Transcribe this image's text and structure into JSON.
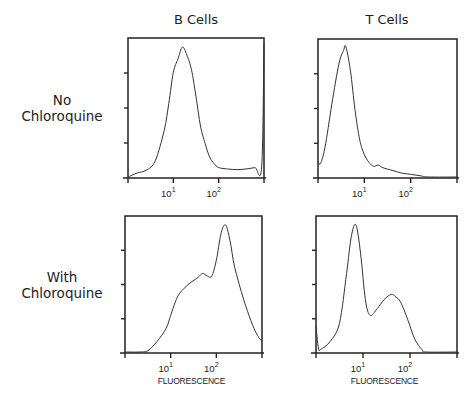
{
  "figure": {
    "column_titles": [
      "B  Cells",
      "T  Cells"
    ],
    "row_labels": [
      [
        "No",
        "Chloroquine"
      ],
      [
        "With",
        "Chloroquine"
      ]
    ],
    "x_axis_label": "FLUORESCENCE",
    "x_tick_base": "10",
    "x_tick_exponents": [
      "1",
      "2"
    ]
  },
  "chart_data": [
    {
      "type": "line",
      "title": "B Cells — No Chloroquine",
      "xlabel": "Fluorescence (log)",
      "ylabel": "Cell count",
      "x_scale": "log",
      "xlim_decades": [
        0,
        3
      ],
      "x_ticks": [
        "10^1",
        "10^2"
      ],
      "grid": false,
      "peak_x_decades": 1.2,
      "x": [
        0.0,
        0.2,
        0.4,
        0.6,
        0.8,
        0.9,
        1.0,
        1.1,
        1.2,
        1.3,
        1.4,
        1.5,
        1.6,
        1.7,
        1.8,
        1.9,
        2.0,
        2.2,
        2.4,
        2.6,
        2.8,
        2.95,
        3.0
      ],
      "y": [
        0,
        3,
        5,
        12,
        35,
        55,
        78,
        88,
        97,
        91,
        80,
        60,
        38,
        25,
        15,
        10,
        7,
        6,
        5.5,
        6,
        7,
        8,
        100
      ]
    },
    {
      "type": "line",
      "title": "T Cells — No Chloroquine",
      "xlabel": "Fluorescence (log)",
      "ylabel": "Cell count",
      "x_scale": "log",
      "xlim_decades": [
        0,
        3
      ],
      "x_ticks": [
        "10^1",
        "10^2"
      ],
      "grid": false,
      "peak_x_decades": 0.6,
      "x": [
        0.0,
        0.05,
        0.15,
        0.3,
        0.45,
        0.55,
        0.6,
        0.7,
        0.8,
        0.9,
        1.0,
        1.1,
        1.2,
        1.3,
        1.4,
        1.6,
        1.8,
        2.0,
        2.2,
        2.4,
        3.0
      ],
      "y": [
        12,
        10,
        22,
        55,
        85,
        95,
        98,
        80,
        50,
        28,
        17,
        11,
        8,
        9,
        7,
        5,
        3,
        2,
        1,
        0,
        0
      ]
    },
    {
      "type": "line",
      "title": "B Cells — With Chloroquine",
      "xlabel": "FLUORESCENCE",
      "ylabel": "Cell count",
      "x_scale": "log",
      "xlim_decades": [
        0,
        3
      ],
      "x_ticks": [
        "10^1",
        "10^2"
      ],
      "grid": false,
      "peak_x_decades": 2.2,
      "x": [
        0.0,
        0.3,
        0.5,
        0.7,
        0.9,
        1.0,
        1.1,
        1.2,
        1.4,
        1.6,
        1.7,
        1.8,
        1.9,
        2.0,
        2.1,
        2.2,
        2.3,
        2.4,
        2.6,
        2.8,
        2.95,
        3.0
      ],
      "y": [
        0,
        0,
        1,
        8,
        18,
        28,
        38,
        45,
        52,
        57,
        60,
        58,
        58,
        70,
        90,
        97,
        85,
        65,
        40,
        20,
        10,
        10
      ]
    },
    {
      "type": "line",
      "title": "T Cells — With Chloroquine",
      "xlabel": "FLUORESCENCE",
      "ylabel": "Cell count",
      "x_scale": "log",
      "xlim_decades": [
        0,
        3
      ],
      "x_ticks": [
        "10^1",
        "10^2"
      ],
      "grid": false,
      "peak_x_decades": [
        0.85,
        1.7
      ],
      "x": [
        0.0,
        0.05,
        0.1,
        0.3,
        0.5,
        0.65,
        0.75,
        0.85,
        0.95,
        1.05,
        1.15,
        1.3,
        1.45,
        1.6,
        1.7,
        1.8,
        1.95,
        2.1,
        2.25,
        2.35,
        3.0
      ],
      "y": [
        20,
        3,
        2,
        8,
        22,
        60,
        88,
        97,
        75,
        40,
        28,
        33,
        40,
        44,
        42,
        38,
        25,
        10,
        2,
        0,
        0
      ]
    }
  ]
}
